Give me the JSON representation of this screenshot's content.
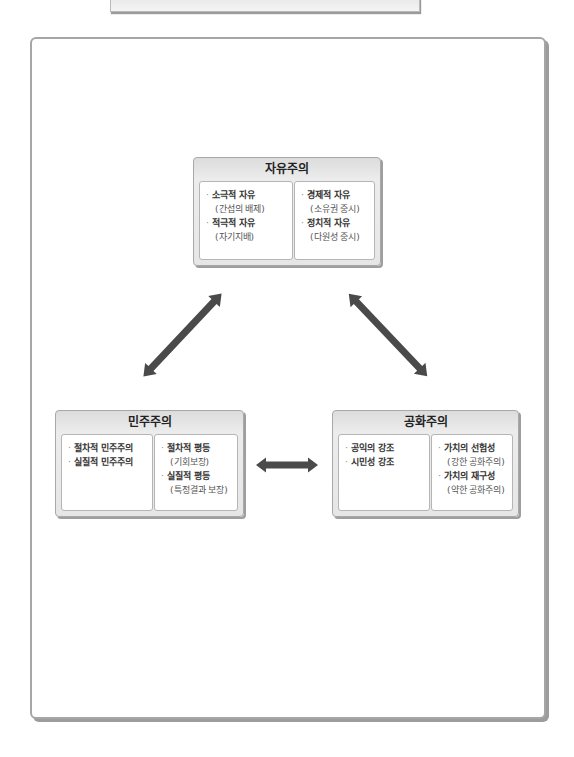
{
  "diagram": {
    "nodes": {
      "liberalism": {
        "title": "자유주의",
        "left_items": [
          {
            "label": "소극적 자유",
            "sub": "(간섭의 배제)"
          },
          {
            "label": "적극적 자유",
            "sub": "(자기지배)"
          }
        ],
        "right_items": [
          {
            "label": "경제적 자유",
            "sub": "(소유권 중시)"
          },
          {
            "label": "정치적 자유",
            "sub": "(다원성 중시)"
          }
        ]
      },
      "democracy": {
        "title": "민주주의",
        "left_items": [
          {
            "label": "절차적 민주주의"
          },
          {
            "label": "실질적 민주주의"
          }
        ],
        "right_items": [
          {
            "label": "절차적 평등",
            "sub": "(기회보장)"
          },
          {
            "label": "실질적 평등",
            "sub": "(특정결과 보장)"
          }
        ]
      },
      "republicanism": {
        "title": "공화주의",
        "left_items": [
          {
            "label": "공익의 강조"
          },
          {
            "label": "시민성 강조"
          }
        ],
        "right_items": [
          {
            "label": "가치의 선험성",
            "sub": "(강한 공화주의)"
          },
          {
            "label": "가치의 재구성",
            "sub": "(약한 공화주의)"
          }
        ]
      }
    },
    "bullet": "·",
    "edges": [
      {
        "from": "liberalism",
        "to": "democracy",
        "type": "double-arrow"
      },
      {
        "from": "liberalism",
        "to": "republicanism",
        "type": "double-arrow"
      },
      {
        "from": "democracy",
        "to": "republicanism",
        "type": "double-arrow"
      }
    ],
    "colors": {
      "frame_border": "#a6a6a6",
      "header_bg": "#e4e4e4",
      "arrow_dark": "#555555",
      "arrow_light": "#e0e0e0"
    }
  }
}
